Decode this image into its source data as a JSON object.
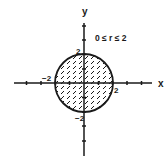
{
  "diagram": {
    "type": "polar-region",
    "condition_label": "0 ≤ r ≤ 2",
    "axes": {
      "x_label": "x",
      "y_label": "y",
      "tick_labels": {
        "x_neg": "−2",
        "x_pos": "2",
        "y_pos": "2",
        "y_neg": "−2"
      },
      "ticks_per_side": 4,
      "unit_px": 14.5
    },
    "region": {
      "shape": "circle",
      "center": [
        0,
        0
      ],
      "radius": 2,
      "fill": "diagonal-hatch"
    },
    "colors": {
      "ink": "#1a1a1a",
      "background": "#ffffff"
    }
  }
}
